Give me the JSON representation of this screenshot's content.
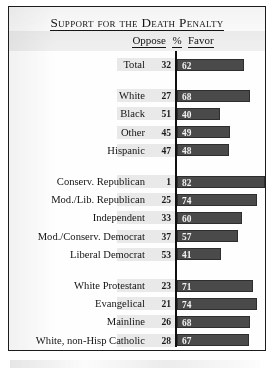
{
  "title": "Support for the Death Penalty",
  "header": {
    "oppose": "Oppose",
    "percent": "%",
    "favor": "Favor"
  },
  "colors": {
    "bar": "#4a4a4a",
    "bar_border": "#2e2e2e",
    "axis": "#111111",
    "text": "#141414",
    "band": "#cdcdcd",
    "card_border": "#1c1c1c",
    "background": "#fefefe"
  },
  "chart_data": {
    "type": "bar",
    "title": "Support for the Death Penalty",
    "xlabel": "",
    "ylabel": "",
    "xlim": [
      0,
      100
    ],
    "grid": false,
    "legend": "none",
    "orientation": "horizontal",
    "value_unit": "%",
    "columns": [
      "Oppose",
      "%",
      "Favor"
    ],
    "note": "Bar length encodes the Favor percentage; Oppose is shown as a number only.",
    "groups": [
      {
        "name": "overall",
        "rows": [
          {
            "label": "Total",
            "oppose": 32,
            "favor": 62
          }
        ]
      },
      {
        "name": "race-ethnicity",
        "rows": [
          {
            "label": "White",
            "oppose": 27,
            "favor": 68
          },
          {
            "label": "Black",
            "oppose": 51,
            "favor": 40
          },
          {
            "label": "Other",
            "oppose": 45,
            "favor": 49
          },
          {
            "label": "Hispanic",
            "oppose": 47,
            "favor": 48
          }
        ]
      },
      {
        "name": "party-ideology",
        "rows": [
          {
            "label": "Conserv. Republican",
            "oppose": 1,
            "favor": 82
          },
          {
            "label": "Mod./Lib. Republican",
            "oppose": 25,
            "favor": 74
          },
          {
            "label": "Independent",
            "oppose": 33,
            "favor": 60
          },
          {
            "label": "Mod./Conserv. Democrat",
            "oppose": 37,
            "favor": 57
          },
          {
            "label": "Liberal Democrat",
            "oppose": 53,
            "favor": 41
          }
        ]
      },
      {
        "name": "religion",
        "rows": [
          {
            "label": "White Protestant",
            "oppose": 23,
            "favor": 71
          },
          {
            "label": "Evangelical",
            "oppose": 21,
            "favor": 74
          },
          {
            "label": "Mainline",
            "oppose": 26,
            "favor": 68
          },
          {
            "label": "White, non-Hisp Catholic",
            "oppose": 28,
            "favor": 67
          },
          {
            "label": "Unaffiliated",
            "oppose": 36,
            "favor": 59
          }
        ]
      }
    ]
  }
}
